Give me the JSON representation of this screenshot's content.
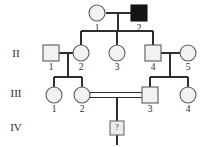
{
  "figure": {
    "kind": "pedigree-chart",
    "title": "",
    "colors": {
      "affected_fill": "#141414",
      "unaffected_fill": "#f2f2f2",
      "unknown_fill": "#ececec",
      "symbol_stroke": "#5a5a5a",
      "line": "#2e2e2e",
      "background": "#ffffff",
      "text": "#2b2b2b"
    }
  },
  "generation_labels": [
    {
      "text": "II",
      "x": 16,
      "y": 54
    },
    {
      "text": "III",
      "x": 16,
      "y": 94
    },
    {
      "text": "IV",
      "x": 16,
      "y": 128
    }
  ],
  "individuals": [
    {
      "id": "I-1",
      "generation": "I",
      "number": "1",
      "sex": "female",
      "shape": "circle",
      "status": "unaffected",
      "filled": false,
      "x": 97,
      "y": 13,
      "label_x": 97,
      "label_y": 29
    },
    {
      "id": "I-2",
      "generation": "I",
      "number": "2",
      "sex": "male",
      "shape": "square",
      "status": "affected",
      "filled": true,
      "x": 139,
      "y": 13,
      "label_x": 139,
      "label_y": 29
    },
    {
      "id": "II-1",
      "generation": "II",
      "number": "1",
      "sex": "male",
      "shape": "square",
      "status": "unaffected",
      "filled": false,
      "x": 51,
      "y": 53,
      "label_x": 51,
      "label_y": 68
    },
    {
      "id": "II-2",
      "generation": "II",
      "number": "2",
      "sex": "female",
      "shape": "circle",
      "status": "unaffected",
      "filled": false,
      "x": 81,
      "y": 53,
      "label_x": 81,
      "label_y": 68
    },
    {
      "id": "II-3",
      "generation": "II",
      "number": "3",
      "sex": "female",
      "shape": "circle",
      "status": "unaffected",
      "filled": false,
      "x": 117,
      "y": 53,
      "label_x": 117,
      "label_y": 68
    },
    {
      "id": "II-4",
      "generation": "II",
      "number": "4",
      "sex": "male",
      "shape": "square",
      "status": "unaffected",
      "filled": false,
      "x": 153,
      "y": 53,
      "label_x": 153,
      "label_y": 68
    },
    {
      "id": "II-5",
      "generation": "II",
      "number": "5",
      "sex": "female",
      "shape": "circle",
      "status": "unaffected",
      "filled": false,
      "x": 188,
      "y": 53,
      "label_x": 188,
      "label_y": 68
    },
    {
      "id": "III-1",
      "generation": "III",
      "number": "1",
      "sex": "female",
      "shape": "circle",
      "status": "unaffected",
      "filled": false,
      "x": 54,
      "y": 95,
      "label_x": 54,
      "label_y": 110
    },
    {
      "id": "III-2",
      "generation": "III",
      "number": "2",
      "sex": "female",
      "shape": "circle",
      "status": "unaffected",
      "filled": false,
      "x": 82,
      "y": 95,
      "label_x": 82,
      "label_y": 110
    },
    {
      "id": "III-3",
      "generation": "III",
      "number": "3",
      "sex": "male",
      "shape": "square",
      "status": "unaffected",
      "filled": false,
      "x": 150,
      "y": 95,
      "label_x": 150,
      "label_y": 110
    },
    {
      "id": "III-4",
      "generation": "III",
      "number": "4",
      "sex": "female",
      "shape": "circle",
      "status": "unaffected",
      "filled": false,
      "x": 188,
      "y": 95,
      "label_x": 188,
      "label_y": 110
    },
    {
      "id": "IV-1",
      "generation": "IV",
      "number": "",
      "sex": "unknown",
      "shape": "square",
      "status": "unknown",
      "filled": false,
      "inner_text": "?",
      "x": 117,
      "y": 128,
      "label_x": 117,
      "label_y": 128
    }
  ],
  "matings": [
    {
      "name": "mating-I1-I2",
      "partners": [
        "I-1",
        "I-2"
      ],
      "consanguineous": false,
      "children": [
        "II-2",
        "II-3",
        "II-4"
      ]
    },
    {
      "name": "mating-II1-II2",
      "partners": [
        "II-1",
        "II-2"
      ],
      "consanguineous": false,
      "children": [
        "III-1",
        "III-2"
      ]
    },
    {
      "name": "mating-II4-II5",
      "partners": [
        "II-4",
        "II-5"
      ],
      "consanguineous": false,
      "children": [
        "III-3",
        "III-4"
      ]
    },
    {
      "name": "mating-III2-III3",
      "partners": [
        "III-2",
        "III-3"
      ],
      "consanguineous": true,
      "children": [
        "IV-1"
      ]
    }
  ]
}
